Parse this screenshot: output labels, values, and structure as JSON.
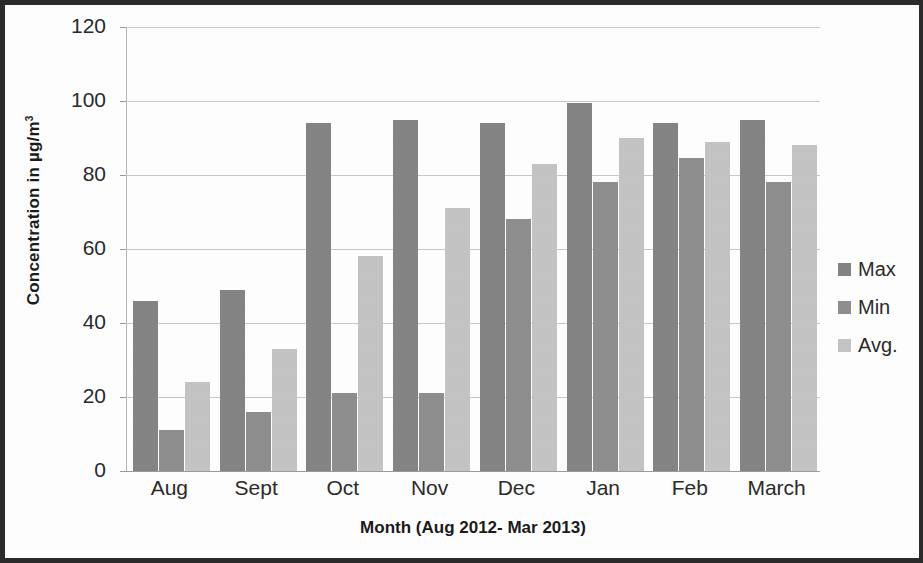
{
  "chart_data": {
    "type": "bar",
    "title": "",
    "subtitle": "",
    "xlabel": "Month (Aug 2012- Mar 2013)",
    "ylabel": "Concentration in µg/m³",
    "ylabel_text": "Concentration in µg/m",
    "ylabel_sup": "3",
    "categories": [
      "Aug",
      "Sept",
      "Oct",
      "Nov",
      "Dec",
      "Jan",
      "Feb",
      "March"
    ],
    "series": [
      {
        "name": "Max",
        "color": "#848484",
        "values": [
          46,
          49,
          94,
          95,
          94,
          99.5,
          94,
          95
        ]
      },
      {
        "name": "Min",
        "color": "#8e8e8e",
        "values": [
          11,
          16,
          21,
          21,
          68,
          78,
          84.5,
          78
        ]
      },
      {
        "name": "Avg.",
        "color": "#c4c4c4",
        "values": [
          24,
          33,
          58,
          71,
          83,
          90,
          89,
          88
        ]
      }
    ],
    "ylim": [
      0,
      120
    ],
    "yticks": [
      0,
      20,
      40,
      60,
      80,
      100,
      120
    ],
    "ytick_labels": [
      "0",
      "20",
      "40",
      "60",
      "80",
      "100",
      "120"
    ],
    "grid": true,
    "grid_axis": "y",
    "legend_position": "right",
    "bar_count_per_group": 3
  },
  "legend": {
    "entries": [
      {
        "label": "Max",
        "color": "#848484"
      },
      {
        "label": "Min",
        "color": "#8e8e8e"
      },
      {
        "label": "Avg.",
        "color": "#c4c4c4"
      }
    ]
  },
  "axes": {
    "y_title": "Concentration in µg/m",
    "y_title_sup": "3",
    "x_title": "Month (Aug 2012- Mar 2013)"
  }
}
